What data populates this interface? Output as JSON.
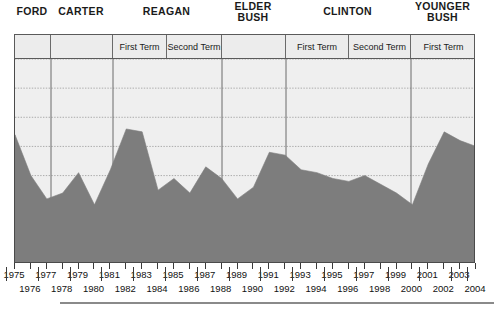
{
  "presidents": [
    {
      "name": "FORD",
      "lines": [
        "FORD"
      ],
      "start_px": 14,
      "end_px": 50
    },
    {
      "name": "CARTER",
      "lines": [
        "CARTER"
      ],
      "start_px": 50,
      "end_px": 112
    },
    {
      "name": "REAGAN",
      "lines": [
        "REAGAN"
      ],
      "start_px": 112,
      "end_px": 221
    },
    {
      "name": "ELDER BUSH",
      "lines": [
        "ELDER",
        "BUSH"
      ],
      "start_px": 221,
      "end_px": 285
    },
    {
      "name": "CLINTON",
      "lines": [
        "CLINTON"
      ],
      "start_px": 285,
      "end_px": 410
    },
    {
      "name": "YOUNGER BUSH",
      "lines": [
        "YOUNGER",
        "BUSH"
      ],
      "start_px": 410,
      "end_px": 475
    }
  ],
  "terms": [
    {
      "label": "",
      "start_px": 14,
      "end_px": 50
    },
    {
      "label": "",
      "start_px": 50,
      "end_px": 112
    },
    {
      "label": "First Term",
      "start_px": 112,
      "end_px": 166
    },
    {
      "label": "Second Term",
      "start_px": 166,
      "end_px": 221
    },
    {
      "label": "",
      "start_px": 221,
      "end_px": 285
    },
    {
      "label": "First Term",
      "start_px": 285,
      "end_px": 348
    },
    {
      "label": "Second Term",
      "start_px": 348,
      "end_px": 410
    },
    {
      "label": "First Term",
      "start_px": 410,
      "end_px": 475
    }
  ],
  "axis": {
    "years_top": [
      "1975",
      "1977",
      "1979",
      "1981",
      "1983",
      "1985",
      "1987",
      "1989",
      "1991",
      "1993",
      "1995",
      "1997",
      "1999",
      "2001",
      "2003"
    ],
    "years_bottom": [
      "1976",
      "1978",
      "1980",
      "1982",
      "1984",
      "1986",
      "1988",
      "1990",
      "1992",
      "1994",
      "1996",
      "1998",
      "2000",
      "2002",
      "2004"
    ]
  },
  "colors": {
    "area_fill": "#7d7d7d",
    "plot_background": "#efefef",
    "band_background": "#ececec",
    "frame": "#4a4a4a",
    "gridline": "#9a9a9a",
    "text": "#111111"
  },
  "chart_data": {
    "type": "area",
    "title": "",
    "subtitle": "",
    "xlabel": "",
    "ylabel": "",
    "grid": true,
    "legend_position": "none",
    "xlim": [
      1975,
      2004
    ],
    "ylim": [
      0,
      7
    ],
    "gridline_values": [
      0,
      1,
      2,
      3,
      4,
      5,
      6,
      7
    ],
    "x": [
      1975,
      1976,
      1977,
      1978,
      1979,
      1980,
      1981,
      1982,
      1983,
      1984,
      1985,
      1986,
      1987,
      1988,
      1989,
      1990,
      1991,
      1992,
      1993,
      1994,
      1995,
      1996,
      1997,
      1998,
      1999,
      2000,
      2001,
      2002,
      2003,
      2004
    ],
    "series": [
      {
        "name": "value",
        "values": [
          4.4,
          3.0,
          2.2,
          2.4,
          3.1,
          2.0,
          3.2,
          4.6,
          4.5,
          2.5,
          2.9,
          2.4,
          3.3,
          2.9,
          2.2,
          2.6,
          3.8,
          3.7,
          3.2,
          3.1,
          2.9,
          2.8,
          3.0,
          2.7,
          2.4,
          2.0,
          3.4,
          4.5,
          4.2,
          4.0
        ]
      }
    ],
    "annotations": [
      {
        "text": "peak near 1991",
        "x": 1991,
        "y": 6.9
      },
      {
        "text": "peak near 2002",
        "x": 2002,
        "y": 6.9
      }
    ],
    "president_bands": [
      {
        "label": "FORD",
        "x_start": 1975,
        "x_end": 1977
      },
      {
        "label": "CARTER",
        "x_start": 1977,
        "x_end": 1981
      },
      {
        "label": "REAGAN",
        "x_start": 1981,
        "x_end": 1989
      },
      {
        "label": "ELDER BUSH",
        "x_start": 1989,
        "x_end": 1993
      },
      {
        "label": "CLINTON",
        "x_start": 1993,
        "x_end": 2001
      },
      {
        "label": "YOUNGER BUSH",
        "x_start": 2001,
        "x_end": 2004
      }
    ]
  }
}
